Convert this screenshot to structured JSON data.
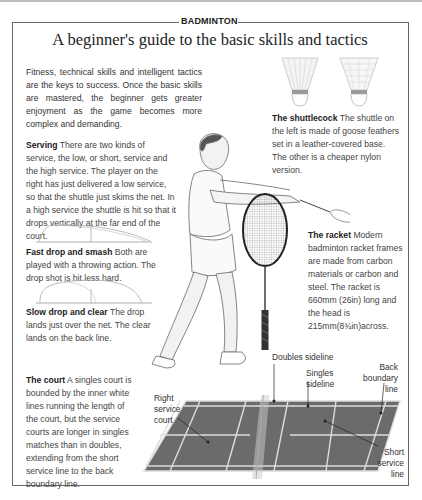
{
  "header": {
    "section_label": "BADMINTON",
    "title": "A beginner's guide to the basic skills and tactics"
  },
  "intro": "Fitness, technical skills and intelligent tactics are the keys to success. Once the basic skills are mastered, the beginner gets greater enjoyment as the game becomes more complex and demanding.",
  "sections": {
    "serving": {
      "heading": "Serving",
      "body": " There are two kinds of service, the low, or short, service and the high service. The player on the right has just delivered a low service, so that the shuttle just skims the net. In a high service the shuttle is hit so that it drops vertically at the far end of the court."
    },
    "fast_drop": {
      "heading": "Fast drop and smash",
      "body": " Both are played with a throwing action. The drop shot is hit less hard."
    },
    "slow_drop": {
      "heading": "Slow drop and clear",
      "body": " The drop lands just over the net. The clear lands on the back line."
    },
    "court": {
      "heading": "The court",
      "body": " A singles court is bounded by the inner white lines running the length of the court, but the service courts are longer in singles matches than in doubles, extending from the short service line to the back boundary line."
    },
    "shuttlecock": {
      "heading": "The shuttlecock",
      "body": " The shuttle on the left is made of goose feathers set in a leather-covered base. The other is a cheaper nylon version."
    },
    "racket": {
      "heading": "The racket",
      "body": " Modern badminton racket frames are made from carbon materials or carbon and steel. The racket is 660mm (26in) long and the head is 215mm(8¾in)across."
    }
  },
  "court_labels": {
    "doubles_sideline": "Doubles sideline",
    "singles_sideline_1": "Singles",
    "singles_sideline_2": "sideline",
    "back_boundary_1": "Back",
    "back_boundary_2": "boundary",
    "back_boundary_3": "line",
    "right_service_1": "Right",
    "right_service_2": "service",
    "right_service_3": "court",
    "short_service_1": "Short",
    "short_service_2": "service",
    "short_service_3": "line"
  }
}
